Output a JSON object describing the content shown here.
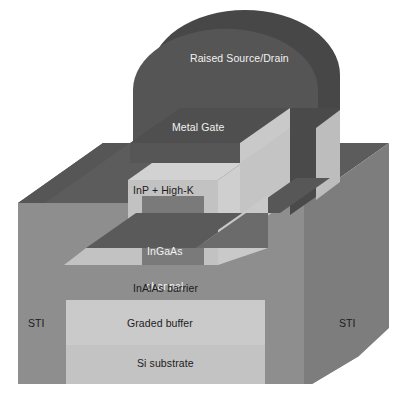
{
  "figure": {
    "background_color": "#ffffff",
    "width": 407,
    "height": 398
  },
  "palette": {
    "dome_dark": "#4a4a4a",
    "dome_mid": "#565656",
    "base_top_dark": "#5a5a5a",
    "base_front": "#8c8c8c",
    "base_right": "#7b7b7b",
    "gate_top": "#545454",
    "gate_face_light": "#c9c9c9",
    "gate_face_mid": "#a0a0a0",
    "inp_light": "#c2c2c2",
    "channel_gray": "#7a7a7a",
    "barrier_gray": "#8c8c8c",
    "buffer_light": "#c9c9c9",
    "substrate_light": "#c4c4c4",
    "sti_dark": "#6f6f6f",
    "label_light": "#f2f2f2",
    "label_dark": "#1c1c1c"
  },
  "labels": {
    "raised_source_drain": "Raised Source/Drain",
    "metal_gate": "Metal Gate",
    "inp_high_k": "InP + High-K",
    "ingaas_channel_line1": "InGaAs",
    "ingaas_channel_line2": "channel",
    "inalas_barrier": "InAlAs barrier",
    "graded_buffer": "Graded buffer",
    "si_substrate": "Si substrate",
    "sti_left": "STI",
    "sti_right": "STI"
  }
}
